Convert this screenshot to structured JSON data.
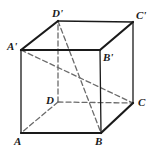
{
  "figure": {
    "name": "labeled-cube-diagram",
    "width": 161,
    "height": 155,
    "background_color": "#ffffff",
    "solid_stroke_color": "#1a1a1a",
    "dashed_stroke_color": "#6b6b6b",
    "solid_stroke_width": 2.2,
    "thin_stroke_width": 1.3,
    "dashed_stroke_width": 1.3,
    "dash_pattern": "5,3"
  },
  "vertices": [
    {
      "id": "A",
      "label": "A",
      "x": 21,
      "y": 133,
      "label_x": 14,
      "label_y": 136
    },
    {
      "id": "B",
      "label": "B",
      "x": 101,
      "y": 133,
      "label_x": 95,
      "label_y": 136
    },
    {
      "id": "C",
      "label": "C",
      "x": 133,
      "y": 103,
      "label_x": 138,
      "label_y": 97
    },
    {
      "id": "D",
      "label": "D",
      "x": 58,
      "y": 102,
      "label_x": 46,
      "label_y": 95
    },
    {
      "id": "Aprime",
      "label": "A'",
      "x": 21,
      "y": 50,
      "label_x": 7,
      "label_y": 41
    },
    {
      "id": "Bprime",
      "label": "B'",
      "x": 100,
      "y": 50,
      "label_x": 103,
      "label_y": 52
    },
    {
      "id": "Cprime",
      "label": "C'",
      "x": 133,
      "y": 22,
      "label_x": 136,
      "label_y": 10
    },
    {
      "id": "Dprime",
      "label": "D'",
      "x": 58,
      "y": 21,
      "label_x": 52,
      "label_y": 8
    }
  ],
  "edges": {
    "solid": [
      {
        "name": "edge-A-B",
        "from": "A",
        "to": "B",
        "weight": "thick"
      },
      {
        "name": "edge-B-C",
        "from": "B",
        "to": "C",
        "weight": "thick"
      },
      {
        "name": "edge-C-Cprime",
        "from": "C",
        "to": "Cprime",
        "weight": "thin"
      },
      {
        "name": "edge-A-Aprime",
        "from": "A",
        "to": "Aprime",
        "weight": "thin"
      },
      {
        "name": "edge-B-Bprime",
        "from": "B",
        "to": "Bprime",
        "weight": "thin"
      },
      {
        "name": "edge-Aprime-Bprime",
        "from": "Aprime",
        "to": "Bprime",
        "weight": "thick"
      },
      {
        "name": "edge-Bprime-Cprime",
        "from": "Bprime",
        "to": "Cprime",
        "weight": "thick"
      },
      {
        "name": "edge-Aprime-Dprime",
        "from": "Aprime",
        "to": "Dprime",
        "weight": "thick"
      },
      {
        "name": "edge-Dprime-Cprime",
        "from": "Dprime",
        "to": "Cprime",
        "weight": "thin"
      }
    ],
    "dashed": [
      {
        "name": "hidden-edge-D-A",
        "from": "D",
        "to": "A"
      },
      {
        "name": "hidden-edge-D-C",
        "from": "D",
        "to": "C"
      },
      {
        "name": "hidden-edge-D-Dprime",
        "from": "D",
        "to": "Dprime"
      }
    ],
    "diagonals": [
      {
        "name": "space-diagonal-Aprime-C",
        "from": "Aprime",
        "to": "C"
      },
      {
        "name": "space-diagonal-Dprime-B",
        "from": "Dprime",
        "to": "B"
      }
    ]
  }
}
